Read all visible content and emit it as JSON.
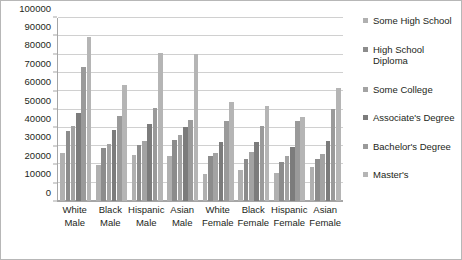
{
  "chart_data": {
    "type": "bar",
    "title": "",
    "xlabel": "",
    "ylabel": "",
    "ylim": [
      0,
      100000
    ],
    "ytick_step": 10000,
    "grid": true,
    "legend_position": "right",
    "categories": [
      "White\nMale",
      "Black\nMale",
      "Hispanic\nMale",
      "Asian\nMale",
      "White\nFemale",
      "Black\nFemale",
      "Hispanic\nFemale",
      "Asian\nFemale"
    ],
    "ytick_labels": [
      "0",
      "10000",
      "20000",
      "30000",
      "40000",
      "50000",
      "60000",
      "70000",
      "80000",
      "90000",
      "100000"
    ],
    "series": [
      {
        "name": "Some High School",
        "color": "#b0b0b0",
        "values": [
          26000,
          19500,
          25300,
          24700,
          15000,
          17000,
          15200,
          18500
        ]
      },
      {
        "name": "High School Diploma",
        "color": "#8c8c8c",
        "values": [
          38000,
          29200,
          30800,
          33500,
          24500,
          23000,
          21500,
          23200
        ]
      },
      {
        "name": "Some College",
        "color": "#a3a3a3",
        "values": [
          41000,
          31000,
          33000,
          36000,
          26500,
          27000,
          24500,
          25500
        ]
      },
      {
        "name": "Associate's Degree",
        "color": "#7c7c7c",
        "values": [
          48300,
          38700,
          42000,
          40400,
          32000,
          32500,
          29500,
          32800
        ]
      },
      {
        "name": "Bachelor's Degree",
        "color": "#9a9a9a",
        "values": [
          73200,
          46500,
          50700,
          44300,
          43500,
          41000,
          43500,
          50500
        ]
      },
      {
        "name": "Master's",
        "color": "#b5b5b5",
        "values": [
          89800,
          63500,
          80700,
          80100,
          54300,
          52000,
          45800,
          61700
        ]
      }
    ]
  },
  "legend": {
    "items": [
      {
        "label": "Some High School"
      },
      {
        "label": "High School Diploma"
      },
      {
        "label": "Some College"
      },
      {
        "label": "Associate's Degree"
      },
      {
        "label": "Bachelor's Degree"
      },
      {
        "label": "Master's"
      }
    ]
  }
}
